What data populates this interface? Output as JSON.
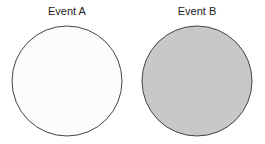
{
  "diagram": {
    "type": "two-circle event illustration",
    "events": [
      {
        "label": "Event A",
        "fill": "#fcfcfc",
        "stroke": "#444444"
      },
      {
        "label": "Event B",
        "fill": "#c8c8c8",
        "stroke": "#444444"
      }
    ]
  }
}
